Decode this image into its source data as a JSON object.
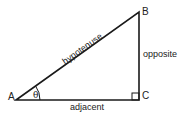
{
  "diagram": {
    "type": "right-triangle",
    "vertices": [
      {
        "id": "A",
        "label": "A",
        "x": 16,
        "y": 100
      },
      {
        "id": "B",
        "label": "B",
        "x": 139,
        "y": 12
      },
      {
        "id": "C",
        "label": "C",
        "x": 139,
        "y": 100
      }
    ],
    "sides": {
      "hypotenuse": "hypotenuse",
      "opposite": "opposite",
      "adjacent": "adjacent"
    },
    "angle_label": "θ",
    "right_angle_at": "C",
    "stroke_color": "#1a1a1a"
  }
}
